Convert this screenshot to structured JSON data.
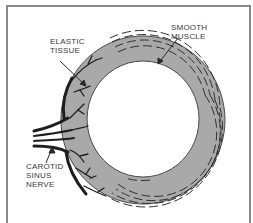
{
  "figure": {
    "type": "anatomical cross-section",
    "colors": {
      "frame": "#8a8a8a",
      "tissue_fill": "#a9a9a9",
      "lines": "#2a2a2a",
      "background": "#ffffff",
      "text": "#3a3a3a"
    }
  },
  "labels": {
    "elastic_tissue": {
      "line1": "ELASTIC",
      "line2": "TISSUE"
    },
    "smooth_muscle": {
      "line1": "SMOOTH",
      "line2": "MUSCLE"
    },
    "carotid_sinus_nerve": {
      "line1": "CAROTID",
      "line2": "SINUS",
      "line3": "NERVE"
    }
  }
}
